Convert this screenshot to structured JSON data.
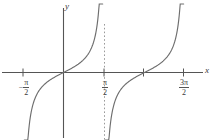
{
  "figure": {
    "kind": "math-graph",
    "background_color": "#ffffff",
    "curve_color": "#6e6e6e",
    "axis_color": "#555555",
    "asymptote_color": "#8c8c8c",
    "text_color": "#3a3a3a"
  },
  "axes": {
    "x_axis_label": "x",
    "y_axis_label": "y",
    "x_ticks": [
      {
        "label_sign": "−",
        "numerator": "π",
        "denominator": "2",
        "value": "-pi/2"
      },
      {
        "label_sign": "",
        "numerator": "π",
        "denominator": "2",
        "value": "pi/2"
      },
      {
        "label_sign": "",
        "numerator": "3π",
        "denominator": "2",
        "value": "3pi/2"
      }
    ]
  },
  "chart_data": {
    "type": "line",
    "title": "",
    "xlabel": "x",
    "ylabel": "y",
    "function": "y = tan(x)",
    "grid": false,
    "legend": null,
    "xlim": [
      -2.35,
      5.45
    ],
    "ylim": [
      -5.2,
      5.2
    ],
    "x_tick_values": [
      -1.5708,
      1.5708,
      4.7124
    ],
    "x_tick_labels": [
      "−π/2",
      "π/2",
      "3π/2"
    ],
    "y_tick_values": [],
    "y_tick_labels": [],
    "asymptotes": [
      -1.5708,
      1.5708,
      4.7124
    ],
    "asymptote_drawn_dashed": [
      1.5708
    ],
    "zeros": [
      0,
      3.1416
    ],
    "series": [
      {
        "name": "tan(x) branch 1",
        "x": [
          -1.52,
          -1.45,
          -1.35,
          -1.2,
          -1.0,
          -0.8,
          -0.6,
          -0.4,
          -0.2,
          0.0,
          0.2,
          0.4,
          0.6,
          0.8,
          1.0,
          1.2,
          1.35,
          1.45,
          1.52
        ],
        "y": [
          -19.7,
          -7.6,
          -4.46,
          -2.57,
          -1.56,
          -1.03,
          -0.68,
          -0.42,
          -0.2,
          0.0,
          0.2,
          0.42,
          0.68,
          1.03,
          1.56,
          2.57,
          4.46,
          7.6,
          19.7
        ]
      },
      {
        "name": "tan(x) branch 2",
        "x": [
          1.62,
          1.69,
          1.79,
          1.94,
          2.14,
          2.34,
          2.54,
          2.74,
          2.94,
          3.14,
          3.34,
          3.54,
          3.74,
          3.94,
          4.14,
          4.34,
          4.49,
          4.59,
          4.66
        ],
        "y": [
          -19.7,
          -7.6,
          -4.46,
          -2.57,
          -1.56,
          -1.03,
          -0.68,
          -0.42,
          -0.2,
          0.0,
          0.2,
          0.42,
          0.68,
          1.03,
          1.56,
          2.57,
          4.46,
          7.6,
          19.7
        ]
      }
    ]
  }
}
